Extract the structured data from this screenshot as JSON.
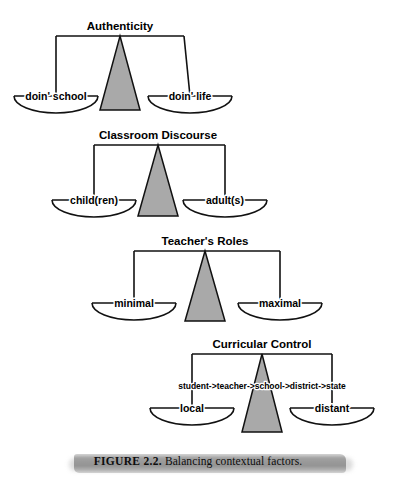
{
  "figure": {
    "caption_number": "FIGURE 2.2.",
    "caption_text": "Balancing contextual factors.",
    "background_color": "#ffffff",
    "ink_color": "#111111",
    "fulcrum_color": "#a9a9a9",
    "caption_band_color": "#8a8a8a"
  },
  "scales": [
    {
      "title": "Authenticity",
      "left_label": "doin' school",
      "right_label": "doin' life",
      "chain_label": "",
      "geometry": {
        "title_x": 120,
        "title_y": 30,
        "beam_y": 36,
        "beam_x1": 56,
        "beam_x2": 184,
        "pan_y": 96,
        "left_pan_cx": 56,
        "right_pan_cx": 190,
        "pan_half_width": 42,
        "pan_depth": 17,
        "fulcrum_apex_x": 120,
        "fulcrum_base_y": 110,
        "fulcrum_half_base": 20
      }
    },
    {
      "title": "Classroom Discourse",
      "left_label": "child(ren)",
      "right_label": "adult(s)",
      "chain_label": "",
      "geometry": {
        "title_x": 158,
        "title_y": 139,
        "beam_y": 145,
        "beam_x1": 94,
        "beam_x2": 225,
        "pan_y": 200,
        "left_pan_cx": 94,
        "right_pan_cx": 225,
        "pan_half_width": 42,
        "pan_depth": 17,
        "fulcrum_apex_x": 158,
        "fulcrum_base_y": 216,
        "fulcrum_half_base": 20
      }
    },
    {
      "title": "Teacher's Roles",
      "left_label": "minimal",
      "right_label": "maximal",
      "chain_label": "",
      "geometry": {
        "title_x": 205,
        "title_y": 245,
        "beam_y": 251,
        "beam_x1": 134,
        "beam_x2": 280,
        "pan_y": 303,
        "left_pan_cx": 134,
        "right_pan_cx": 280,
        "pan_half_width": 42,
        "pan_depth": 17,
        "fulcrum_apex_x": 205,
        "fulcrum_base_y": 321,
        "fulcrum_half_base": 20
      }
    },
    {
      "title": "Curricular Control",
      "left_label": "local",
      "right_label": "distant",
      "chain_label": "student->teacher->school->district->state",
      "geometry": {
        "title_x": 262,
        "title_y": 348,
        "beam_y": 354,
        "beam_x1": 192,
        "beam_x2": 332,
        "pan_y": 408,
        "left_pan_cx": 192,
        "right_pan_cx": 332,
        "pan_half_width": 42,
        "pan_depth": 17,
        "fulcrum_apex_x": 262,
        "fulcrum_base_y": 432,
        "fulcrum_half_base": 20,
        "chain_x": 262,
        "chain_y": 389
      }
    }
  ]
}
